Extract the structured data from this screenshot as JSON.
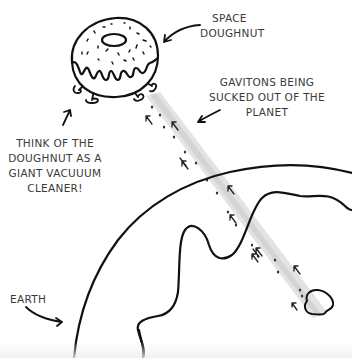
{
  "figure": {
    "labels": {
      "space_doughnut": [
        "SPACE",
        "DOUGHNUT"
      ],
      "gravitons": [
        "GAVITONS BEING",
        "SUCKED OUT OF THE",
        "PLANET"
      ],
      "vacuum": [
        "THINK OF THE",
        "DOUGHNUT AS A",
        "GIANT VACUUUM",
        "CLEANER!"
      ],
      "earth": [
        "EARTH"
      ]
    },
    "colors": {
      "ink": "#111111",
      "text": "#3a3a3a",
      "beam": "#dcdcdc",
      "background": "#ffffff"
    },
    "elements": [
      {
        "name": "space-doughnut",
        "description": "cartoon doughnut with icing, sprinkles and four little feet"
      },
      {
        "name": "graviton-beam",
        "description": "diagonal gray beam from Earth up to doughnut with small upward arrows"
      },
      {
        "name": "earth",
        "description": "large curved planet outline with coastline and a small island"
      }
    ]
  }
}
